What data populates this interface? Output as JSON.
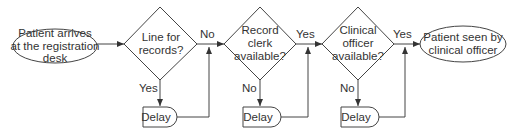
{
  "diagram": {
    "type": "flowchart",
    "nodes": {
      "start": {
        "kind": "terminator",
        "lines": [
          "Patient arrives",
          "at the registration",
          "desk"
        ]
      },
      "decision1": {
        "kind": "decision",
        "lines": [
          "Line for",
          "records?"
        ]
      },
      "decision2": {
        "kind": "decision",
        "lines": [
          "Record",
          "clerk",
          "available?"
        ]
      },
      "decision3": {
        "kind": "decision",
        "lines": [
          "Clinical",
          "officer",
          "available?"
        ]
      },
      "end": {
        "kind": "terminator",
        "lines": [
          "Patient seen by",
          "clinical officer"
        ]
      },
      "delay1": {
        "kind": "delay",
        "label": "Delay"
      },
      "delay2": {
        "kind": "delay",
        "label": "Delay"
      },
      "delay3": {
        "kind": "delay",
        "label": "Delay"
      }
    },
    "edges": {
      "d1_down": "Yes",
      "d1_right": "No",
      "d2_down": "No",
      "d2_right": "Yes",
      "d3_down": "No",
      "d3_right": "Yes"
    }
  }
}
